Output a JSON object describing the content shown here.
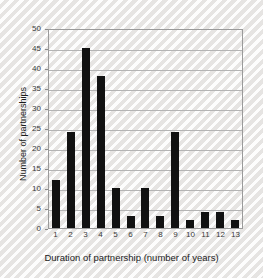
{
  "chart_data": {
    "type": "bar",
    "title": "",
    "xlabel": "Duration of partnership (number of years)",
    "ylabel": "Number of partnerships",
    "categories": [
      "1",
      "2",
      "3",
      "4",
      "5",
      "6",
      "7",
      "8",
      "9",
      "10",
      "11",
      "12",
      "13"
    ],
    "values": [
      12,
      24,
      45,
      38,
      10,
      3,
      10,
      3,
      24,
      2,
      4,
      4,
      2
    ],
    "ylim": [
      0,
      50
    ],
    "ytick_labels": [
      "0",
      "5",
      "10",
      "15",
      "20",
      "25",
      "30",
      "35",
      "40",
      "45",
      "50"
    ],
    "ytick_values": [
      0,
      5,
      10,
      15,
      20,
      25,
      30,
      35,
      40,
      45,
      50
    ],
    "grid": true,
    "grid_axis": "y",
    "legend": false,
    "legend_position": "none",
    "bar_color": "#111111",
    "grid_color": "#b4b4b4",
    "frame_color": "#9a9a9a",
    "background_color": "#f2f1f0",
    "text_color": "#1c1c1c"
  }
}
